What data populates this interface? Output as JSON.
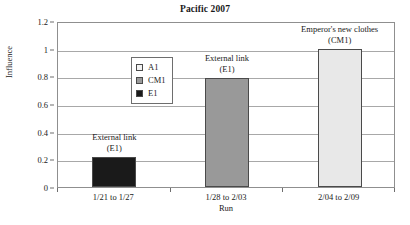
{
  "chart_data": {
    "type": "bar",
    "title": "Pacific 2007",
    "xlabel": "Run",
    "ylabel": "Influence",
    "categories": [
      "1/21 to 1/27",
      "1/28 to 2/03",
      "2/04 to 2/09"
    ],
    "values": [
      0.22,
      0.79,
      1.0
    ],
    "series": [
      {
        "name": "A1",
        "color": "#e8e8e8"
      },
      {
        "name": "CM1",
        "color": "#999999"
      },
      {
        "name": "E1",
        "color": "#1a1a1a"
      }
    ],
    "bars": [
      {
        "category": "1/21 to 1/27",
        "value": 0.22,
        "series": "E1",
        "color": "#1a1a1a"
      },
      {
        "category": "1/28 to 2/03",
        "value": 0.79,
        "series": "CM1",
        "color": "#999999"
      },
      {
        "category": "2/04 to 2/09",
        "value": 1.0,
        "series": "A1",
        "color": "#e8e8e8"
      }
    ],
    "ylim": [
      0,
      1.2
    ],
    "ytick_labels": [
      "0",
      "0.2",
      "0.4",
      "0.6",
      "0.8",
      "1",
      "1.2"
    ],
    "ytick_values": [
      0,
      0.2,
      0.4,
      0.6,
      0.8,
      1.0,
      1.2
    ],
    "grid": true,
    "legend_position": "upper left",
    "annotations": [
      {
        "main": "External link",
        "sub": "(E1)",
        "bar_index": 0
      },
      {
        "main": "External link",
        "sub": "(E1)",
        "bar_index": 1
      },
      {
        "main": "Emperor's new clothes",
        "sub": "(CM1)",
        "bar_index": 2
      }
    ]
  },
  "legend": {
    "items": [
      {
        "label": "A1",
        "color": "#f2f2f2"
      },
      {
        "label": "CM1",
        "color": "#9a9a9a"
      },
      {
        "label": "E1",
        "color": "#1a1a1a"
      }
    ]
  }
}
